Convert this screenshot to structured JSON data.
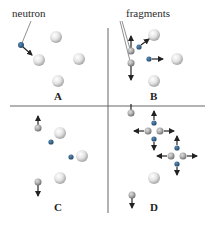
{
  "labels": {
    "neutron": "neutron",
    "fragments": "fragments",
    "panel_a": "A",
    "panel_b": "B",
    "panel_c": "C",
    "panel_d": "D"
  },
  "colors": {
    "neutron": "#2f5f8a",
    "nucleus": "#e6e6e6",
    "fragment": "#a9a9a9",
    "divider": "#555555",
    "arrow": "#222222"
  }
}
